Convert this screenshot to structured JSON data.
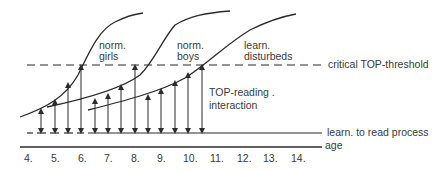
{
  "diagram": {
    "curves": [
      {
        "id": "norm-girls",
        "label_line1": "norm.",
        "label_line2": "girls"
      },
      {
        "id": "norm-boys",
        "label_line1": "norm.",
        "label_line2": "boys"
      },
      {
        "id": "learn-disturbeds",
        "label_line1": "learn.",
        "label_line2": "disturbeds"
      }
    ],
    "threshold_label": "critical TOP-threshold",
    "interaction_label_line1": "TOP-reading .",
    "interaction_label_line2": "interaction",
    "process_label": "learn. to read process",
    "age_axis_label": "age",
    "age_ticks": [
      "4.",
      "5.",
      "6.",
      "7.",
      "8.",
      "9.",
      "10.",
      "11.",
      "12.",
      "13.",
      "14."
    ],
    "colors": {
      "ink": "#2b2b2b",
      "text": "#3a3a3a",
      "background": "#ffffff"
    }
  }
}
